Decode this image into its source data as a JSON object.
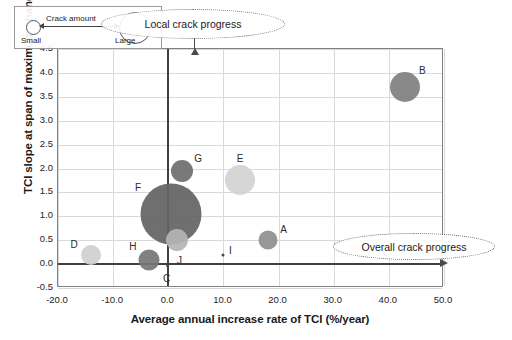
{
  "chart_data": {
    "type": "scatter",
    "title": "",
    "xlabel": "Average annual increase rate of TCI (%/year)",
    "ylabel": "TCI slope at span of maximum change amount",
    "xlim": [
      -20.0,
      50.0
    ],
    "ylim": [
      -0.5,
      4.5
    ],
    "xticks": [
      "-20.0",
      "-10.0",
      "0.0",
      "10.0",
      "20.0",
      "30.0",
      "40.0",
      "50.0"
    ],
    "yticks": [
      "4.5",
      "4.0",
      "3.5",
      "3.0",
      "2.5",
      "2.0",
      "1.5",
      "1.0",
      "0.5",
      "0.0",
      "-0.5"
    ],
    "grid": true,
    "legend_position": "inside-top-left",
    "bubble_meaning": "Bubble area encodes crack amount",
    "points": [
      {
        "label": "B",
        "x": 43.0,
        "y": 3.7,
        "size": 30,
        "color": "#7f7f7f",
        "label_dx": 17,
        "label_dy": -17
      },
      {
        "label": "G",
        "x": 2.5,
        "y": 1.95,
        "size": 22,
        "color": "#6e6e6e",
        "label_dx": 16,
        "label_dy": -13
      },
      {
        "label": "E",
        "x": 13.0,
        "y": 1.75,
        "size": 30,
        "color": "#d2d2d2",
        "label_dx": 0,
        "label_dy": -22
      },
      {
        "label": "F",
        "x": 0.5,
        "y": 1.05,
        "size": 61,
        "color": "#636363",
        "label_dx": -33,
        "label_dy": -27
      },
      {
        "label": "J",
        "x": 1.5,
        "y": 0.5,
        "size": 22,
        "color": "#b4b4b4",
        "label_dx": 3,
        "label_dy": 20
      },
      {
        "label": "A",
        "x": 18.0,
        "y": 0.5,
        "size": 19,
        "color": "#8f8f8f",
        "label_dx": 16,
        "label_dy": -11
      },
      {
        "label": "D",
        "x": -14.0,
        "y": 0.2,
        "size": 20,
        "color": "#cfcfcf",
        "label_dx": -17,
        "label_dy": -11
      },
      {
        "label": "I",
        "x": 10.0,
        "y": 0.2,
        "size": 3,
        "color": "#3a3a3a",
        "label_dx": 7,
        "label_dy": -5
      },
      {
        "label": "H",
        "x": -3.5,
        "y": 0.08,
        "size": 21,
        "color": "#767676",
        "label_dx": -16,
        "label_dy": -14
      },
      {
        "label": "C",
        "x": -0.3,
        "y": -0.05,
        "size": 2,
        "color": "#4a4a4a",
        "label_dx": 0,
        "label_dy": 12
      }
    ]
  },
  "size_legend": {
    "title": "Crack amount",
    "small_label": "Small",
    "large_label": "Large"
  },
  "callouts": {
    "local": "Local crack progress",
    "overall": "Overall crack progress"
  }
}
